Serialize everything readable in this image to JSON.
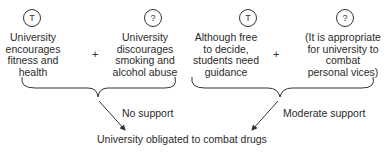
{
  "diagram": {
    "type": "argument-structure",
    "groups": [
      {
        "premises": [
          {
            "marker": "T",
            "lines": [
              "University",
              "encourages",
              "fitness and",
              "health"
            ]
          },
          {
            "marker": "?",
            "lines": [
              "University",
              "discourages",
              "smoking and",
              "alcohol abuse"
            ]
          }
        ],
        "operator": "+",
        "support_label": "No support"
      },
      {
        "premises": [
          {
            "marker": "T",
            "lines": [
              "Although free",
              "to decide,",
              "students need",
              "guidance"
            ]
          },
          {
            "marker": "?",
            "lines": [
              "(It is appropriate",
              "for university to",
              "combat",
              "personal vices)"
            ]
          }
        ],
        "operator": "+",
        "support_label": "Moderate support"
      }
    ],
    "conclusion": "University obligated to combat drugs"
  }
}
